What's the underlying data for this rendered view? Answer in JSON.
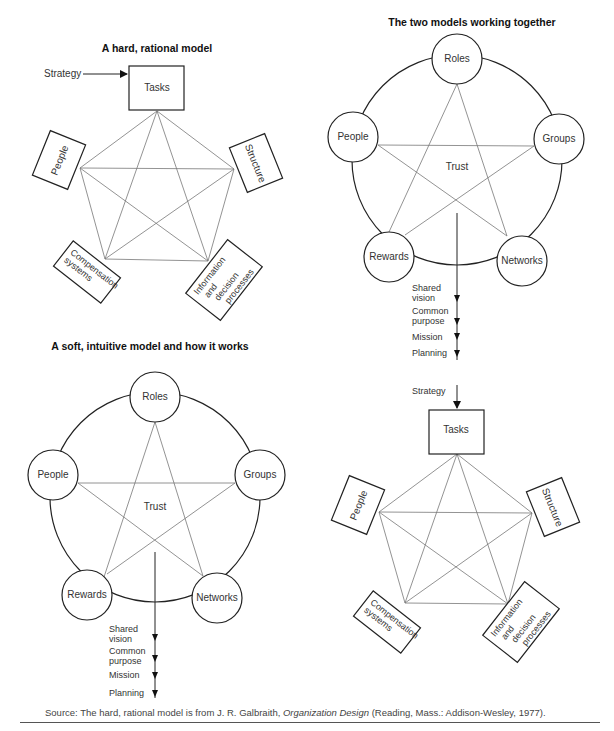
{
  "figure": {
    "header_cropped": "The 7-S and a soft, intuitive organizational design",
    "panels": {
      "hard_model": {
        "title": "A hard, rational model",
        "input_label": "Strategy",
        "nodes": [
          "Tasks",
          "People",
          "Structure",
          "Compensation systems",
          "Information and decision processes"
        ],
        "labels": {
          "tasks": "Tasks",
          "people": "People",
          "structure": "Structure",
          "comp1": "Compensation",
          "comp2": "systems",
          "info1": "Information",
          "info2": "and",
          "info3": "decision",
          "info4": "processes"
        }
      },
      "soft_model": {
        "title": "A soft, intuitive model and how it works",
        "center_label": "Trust",
        "labels": {
          "roles": "Roles",
          "people": "People",
          "groups": "Groups",
          "rewards": "Rewards",
          "networks": "Networks"
        },
        "outputs": {
          "o1a": "Shared",
          "o1b": "vision",
          "o2a": "Common",
          "o2b": "purpose",
          "o3": "Mission",
          "o4": "Planning"
        }
      },
      "combined": {
        "title": "The two models working together",
        "center_label": "Trust",
        "labels": {
          "roles": "Roles",
          "people": "People",
          "groups": "Groups",
          "rewards": "Rewards",
          "networks": "Networks",
          "tasks": "Tasks",
          "structure": "Structure",
          "people2": "People",
          "comp1": "Compensation",
          "comp2": "systems",
          "info1": "Information",
          "info2": "and",
          "info3": "decision",
          "info4": "processes",
          "strategy": "Strategy"
        },
        "outputs": {
          "o1a": "Shared",
          "o1b": "vision",
          "o2a": "Common",
          "o2b": "purpose",
          "o3": "Mission",
          "o4": "Planning"
        }
      }
    },
    "source": {
      "prefix": "Source: The hard, rational model is from J. R. Galbraith, ",
      "book": "Organization Design",
      "suffix": " (Reading, Mass.: Addison-Wesley, 1977)."
    }
  }
}
